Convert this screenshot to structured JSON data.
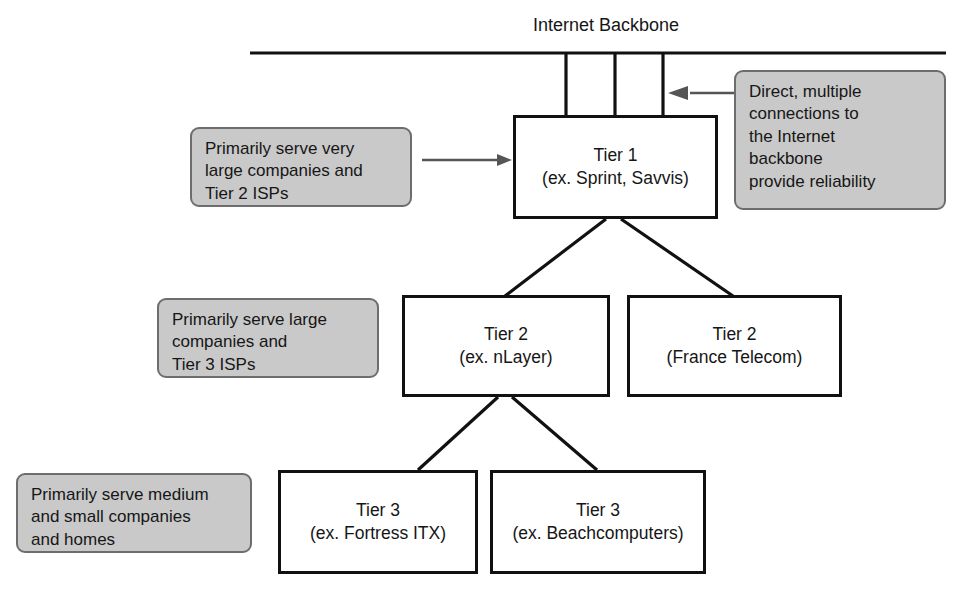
{
  "diagram": {
    "title": "Internet Backbone",
    "backbone_label": "Internet Backbone",
    "colors": {
      "box_border": "#111111",
      "box_fill": "#ffffff",
      "callout_fill": "#c9c9c9",
      "callout_border": "#6d6d6d",
      "line": "#111111",
      "arrow": "#555555",
      "text": "#161616"
    },
    "nodes": [
      {
        "id": "tier1",
        "line1": "Tier 1",
        "line2": "(ex. Sprint, Savvis)"
      },
      {
        "id": "tier2-nlayer",
        "line1": "Tier 2",
        "line2": "(ex. nLayer)"
      },
      {
        "id": "tier2-france-telecom",
        "line1": "Tier 2",
        "line2": "(France Telecom)"
      },
      {
        "id": "tier3-fortress",
        "line1": "Tier 3",
        "line2": "(ex. Fortress ITX)"
      },
      {
        "id": "tier3-beachcomputers",
        "line1": "Tier 3",
        "line2": "(ex. Beachcomputers)"
      }
    ],
    "callouts": [
      {
        "id": "callout-tier1-left",
        "text": "Primarily serve very\nlarge companies and\nTier 2 ISPs"
      },
      {
        "id": "callout-tier1-right",
        "text": "Direct, multiple\nconnections to\nthe Internet\nbackbone\nprovide reliability"
      },
      {
        "id": "callout-tier2",
        "text": "Primarily serve large\ncompanies and\nTier 3 ISPs"
      },
      {
        "id": "callout-tier3",
        "text": "Primarily serve medium\nand small companies\nand homes"
      }
    ]
  }
}
